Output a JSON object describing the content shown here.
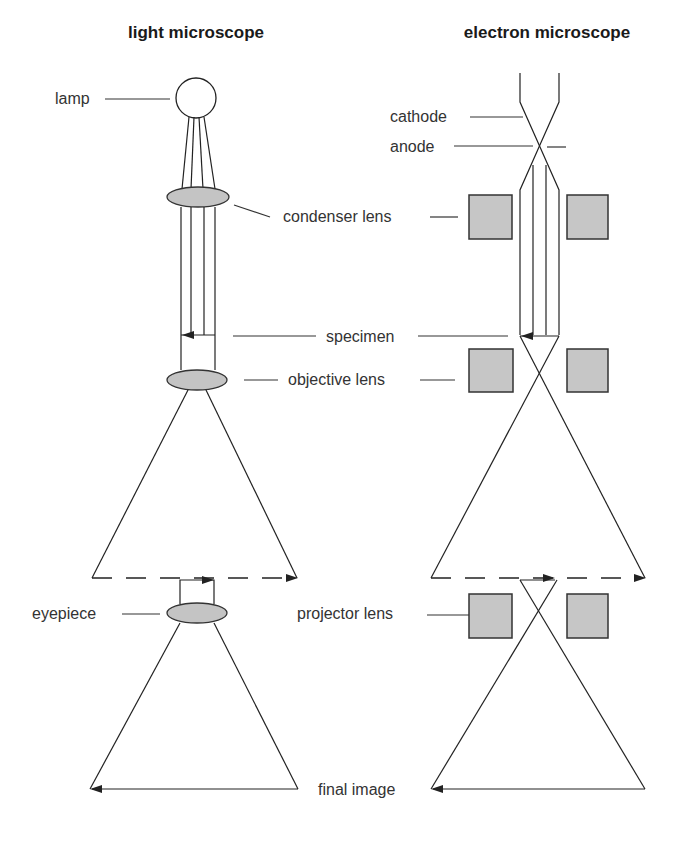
{
  "diagram": {
    "titles": {
      "light": "light microscope",
      "electron": "electron microscope"
    },
    "labels": {
      "lamp": "lamp",
      "cathode": "cathode",
      "anode": "anode",
      "condenser_lens": "condenser lens",
      "specimen": "specimen",
      "objective_lens": "objective lens",
      "eyepiece": "eyepiece",
      "projector_lens": "projector lens",
      "final_image": "final image"
    },
    "colors": {
      "lens_fill": "#c4c4c4",
      "coil_fill": "#c6c6c6",
      "line": "#222222",
      "text": "#333333"
    }
  }
}
